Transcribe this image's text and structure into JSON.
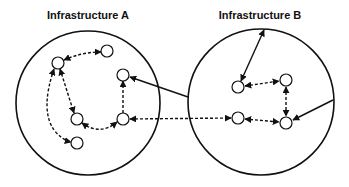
{
  "diagram": {
    "infrastructures": [
      {
        "id": "A",
        "title": "Infrastructure A",
        "cx": 88,
        "cy": 103,
        "r": 72,
        "title_x": 88
      },
      {
        "id": "B",
        "title": "Infrastructure B",
        "cx": 261,
        "cy": 102,
        "r": 73,
        "title_x": 260
      }
    ],
    "nodes": [
      {
        "id": "a1",
        "group": "A",
        "x": 58,
        "y": 63
      },
      {
        "id": "a2",
        "group": "A",
        "x": 107,
        "y": 51
      },
      {
        "id": "a3",
        "group": "A",
        "x": 123,
        "y": 75
      },
      {
        "id": "a4",
        "group": "A",
        "x": 77,
        "y": 119
      },
      {
        "id": "a5",
        "group": "A",
        "x": 123,
        "y": 119
      },
      {
        "id": "a6",
        "group": "A",
        "x": 77,
        "y": 143
      },
      {
        "id": "b1",
        "group": "B",
        "x": 238,
        "y": 87
      },
      {
        "id": "b2",
        "group": "B",
        "x": 286,
        "y": 80
      },
      {
        "id": "b3",
        "group": "B",
        "x": 238,
        "y": 118
      },
      {
        "id": "b4",
        "group": "B",
        "x": 286,
        "y": 123
      }
    ],
    "edges": [
      {
        "from": "a1",
        "to": "a2",
        "style": "dashed",
        "arrows": "both"
      },
      {
        "from": "a1",
        "to": "a4",
        "style": "dashed",
        "arrows": "both"
      },
      {
        "from": "a1",
        "to": "a6",
        "style": "dashed",
        "arrows": "both",
        "curved": true
      },
      {
        "from": "a4",
        "to": "a5",
        "style": "dashed",
        "arrows": "both",
        "curved": true
      },
      {
        "from": "a5",
        "to": "a3",
        "style": "dashed",
        "arrows": "end"
      },
      {
        "from": "a5",
        "to": "b3",
        "style": "dashed",
        "arrows": "both"
      },
      {
        "from": "B-left-edge",
        "to": "a3",
        "style": "solid",
        "arrows": "end"
      },
      {
        "from": "B-top-edge",
        "to": "b1",
        "style": "solid",
        "arrows": "both"
      },
      {
        "from": "b1",
        "to": "b2",
        "style": "dashed",
        "arrows": "both"
      },
      {
        "from": "b2",
        "to": "b4",
        "style": "dashed",
        "arrows": "both"
      },
      {
        "from": "b3",
        "to": "b4",
        "style": "dashed",
        "arrows": "both"
      },
      {
        "from": "B-right-edge",
        "to": "b4",
        "style": "solid",
        "arrows": "end"
      }
    ],
    "colors": {
      "stroke": "#111111",
      "node_fill": "#ffffff",
      "background": "#ffffff"
    }
  }
}
